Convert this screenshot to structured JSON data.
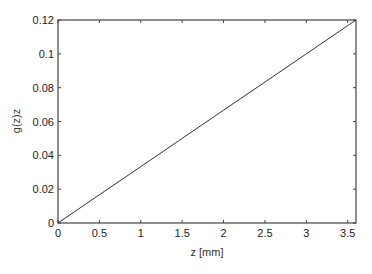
{
  "chart_data": {
    "type": "line",
    "title": "",
    "xlabel": "z [mm]",
    "ylabel": "g(z)z",
    "xlim": [
      0,
      3.6
    ],
    "ylim": [
      0,
      0.12
    ],
    "xticks": [
      "0",
      "0.5",
      "1",
      "1.5",
      "2",
      "2.5",
      "3",
      "3.5"
    ],
    "yticks": [
      "0",
      "0.02",
      "0.04",
      "0.06",
      "0.08",
      "0.1",
      "0.12"
    ],
    "grid": false,
    "legend": null,
    "series": [
      {
        "name": "g(z)z",
        "x": [
          0,
          0.5,
          1,
          1.5,
          2,
          2.5,
          3,
          3.5,
          3.6
        ],
        "values": [
          0,
          0.0167,
          0.0333,
          0.05,
          0.0667,
          0.0833,
          0.1,
          0.1167,
          0.12
        ]
      }
    ]
  }
}
